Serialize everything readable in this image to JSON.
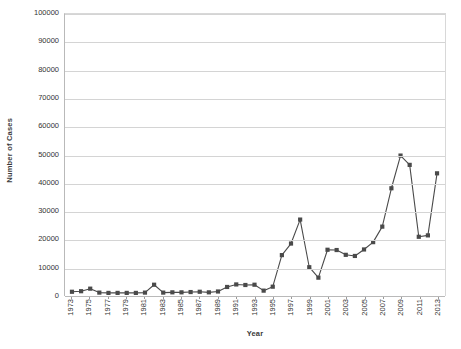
{
  "chart_data": {
    "type": "line",
    "title": "",
    "xlabel": "Year",
    "ylabel": "Number of Cases",
    "grid": true,
    "legend": "none",
    "xlim": [
      1973,
      2013
    ],
    "ylim": [
      0,
      100000
    ],
    "ytick_labels": [
      "0",
      "10000",
      "20000",
      "30000",
      "40000",
      "50000",
      "60000",
      "70000",
      "80000",
      "90000",
      "100000"
    ],
    "ytick_values": [
      0,
      10000,
      20000,
      30000,
      40000,
      50000,
      60000,
      70000,
      80000,
      90000,
      100000
    ],
    "xtick_labels": [
      "1973",
      "1975",
      "1977",
      "1979",
      "1981",
      "1983",
      "1985",
      "1987",
      "1989",
      "1991",
      "1993",
      "1995",
      "1997",
      "1999",
      "2001",
      "2003",
      "2005",
      "2007",
      "2009",
      "2011",
      "2013"
    ],
    "xtick_values": [
      1973,
      1975,
      1977,
      1979,
      1981,
      1983,
      1985,
      1987,
      1989,
      1991,
      1993,
      1995,
      1997,
      1999,
      2001,
      2003,
      2005,
      2007,
      2009,
      2011,
      2013
    ],
    "marker": "square",
    "marker_color": "#4a4a4a",
    "line_color": "#4a4a4a",
    "x": [
      1973,
      1974,
      1975,
      1976,
      1977,
      1978,
      1979,
      1980,
      1981,
      1982,
      1983,
      1984,
      1985,
      1986,
      1987,
      1988,
      1989,
      1990,
      1991,
      1992,
      1993,
      1994,
      1995,
      1996,
      1997,
      1998,
      1999,
      2000,
      2001,
      2002,
      2003,
      2004,
      2005,
      2006,
      2007,
      2008,
      2009,
      2010,
      2011,
      2012,
      2013
    ],
    "values": [
      1500,
      1700,
      2600,
      1200,
      1100,
      1100,
      1100,
      1100,
      1200,
      4000,
      1200,
      1300,
      1300,
      1400,
      1500,
      1300,
      1600,
      3200,
      4100,
      3900,
      4000,
      1900,
      3300,
      14500,
      18600,
      27100,
      10200,
      6500,
      16400,
      16300,
      14600,
      14200,
      16500,
      19100,
      24600,
      38200,
      49800,
      46500,
      21000,
      21500,
      43500
    ]
  }
}
